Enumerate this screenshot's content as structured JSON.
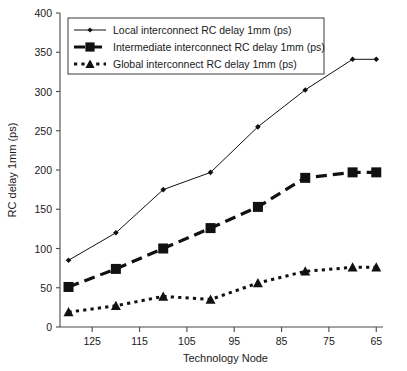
{
  "chart_data": {
    "type": "line",
    "title": "",
    "xlabel": "Technology Node",
    "ylabel": "RC delay 1mm (ps)",
    "x": [
      130,
      120,
      110,
      100,
      90,
      80,
      70,
      65
    ],
    "xtick_labels": [
      "125",
      "115",
      "105",
      "95",
      "85",
      "75",
      "65"
    ],
    "xtick_values": [
      125,
      115,
      105,
      95,
      85,
      75,
      65
    ],
    "xlim": [
      131.8,
      64.0
    ],
    "ytick_labels": [
      "0",
      "50",
      "100",
      "150",
      "200",
      "250",
      "300",
      "350",
      "400"
    ],
    "ytick_values": [
      0,
      50,
      100,
      150,
      200,
      250,
      300,
      350,
      400
    ],
    "ylim": [
      0,
      400
    ],
    "grid": false,
    "legend_position": "top-left-inside",
    "series": [
      {
        "name": "Local interconnect RC delay 1mm (ps)",
        "marker": "diamond",
        "linestyle": "solid",
        "color": "#111111",
        "values": [
          85,
          120,
          175,
          197,
          255,
          302,
          341,
          341
        ]
      },
      {
        "name": "Intermediate interconnect RC delay 1mm (ps)",
        "marker": "square",
        "linestyle": "dashed",
        "color": "#111111",
        "values": [
          51,
          74,
          100,
          126,
          153,
          190,
          197,
          197
        ]
      },
      {
        "name": "Global interconnect RC delay 1mm (ps)",
        "marker": "triangle",
        "linestyle": "dotted",
        "color": "#111111",
        "values": [
          19,
          27,
          39,
          35,
          56,
          71,
          76,
          76
        ]
      }
    ]
  },
  "legend": {
    "items": [
      {
        "label": "Local interconnect RC delay 1mm (ps)",
        "marker": "diamond",
        "linestyle": "solid"
      },
      {
        "label": "Intermediate interconnect RC delay 1mm (ps)",
        "marker": "square",
        "linestyle": "dashed"
      },
      {
        "label": "Global interconnect RC delay 1mm (ps)",
        "marker": "triangle",
        "linestyle": "dotted"
      }
    ]
  },
  "axes": {
    "x_title": "Technology Node",
    "y_title": "RC delay 1mm (ps)"
  }
}
